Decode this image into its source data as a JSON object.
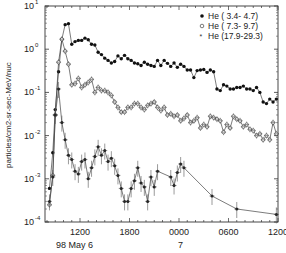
{
  "chart_data": {
    "type": "line",
    "title": "",
    "xlabel": "",
    "ylabel": "particles/cm2-sr-sec-MeV/nuc",
    "yscale": "log",
    "ylim": [
      0.0001,
      10
    ],
    "y_ticks": [
      {
        "base": "10",
        "exp": "1",
        "value": 10
      },
      {
        "base": "10",
        "exp": "0",
        "value": 1
      },
      {
        "base": "10",
        "exp": "-1",
        "value": 0.1
      },
      {
        "base": "10",
        "exp": "-2",
        "value": 0.01
      },
      {
        "base": "10",
        "exp": "-3",
        "value": 0.001
      },
      {
        "base": "10",
        "exp": "-4",
        "value": 0.0001
      }
    ],
    "xlim_hours": [
      7.7,
      36
    ],
    "x_ticks": [
      {
        "label": "1200",
        "hour": 12,
        "sublabel": "98 May  6"
      },
      {
        "label": "1800",
        "hour": 18,
        "sublabel": ""
      },
      {
        "label": "0000",
        "hour": 24,
        "sublabel": "7"
      },
      {
        "label": "0600",
        "hour": 30,
        "sublabel": ""
      },
      {
        "label": "1200",
        "hour": 36,
        "sublabel": ""
      }
    ],
    "x_units": "hours since 98 May 6 0000 UT",
    "legend_position": "upper right",
    "series": [
      {
        "name": "He ( 3.4- 4.7)",
        "marker": "filled-circle",
        "x": [
          8.3,
          8.7,
          9.0,
          9.4,
          9.8,
          10.2,
          10.6,
          11.0,
          11.4,
          11.8,
          12.2,
          12.6,
          13.0,
          13.4,
          13.8,
          14.2,
          14.6,
          15.0,
          15.4,
          15.8,
          16.2,
          16.6,
          17.0,
          17.4,
          17.8,
          18.2,
          18.6,
          19.0,
          19.4,
          19.8,
          20.2,
          20.6,
          21.0,
          21.4,
          21.8,
          22.2,
          22.6,
          23.0,
          23.4,
          23.8,
          24.2,
          24.6,
          25.0,
          25.4,
          25.8,
          26.2,
          26.6,
          27.0,
          27.4,
          27.8,
          28.2,
          28.6,
          29.0,
          29.4,
          29.8,
          30.2,
          30.6,
          31.0,
          31.4,
          31.8,
          32.2,
          32.6,
          33.0,
          33.4,
          33.8,
          34.2,
          34.6,
          35.0,
          35.4,
          35.8
        ],
        "values": [
          0.0006,
          0.004,
          0.04,
          0.3,
          1.7,
          3.7,
          3.9,
          1.3,
          1.5,
          1.6,
          1.6,
          1.8,
          1.65,
          1.3,
          1.25,
          0.85,
          0.75,
          0.62,
          0.55,
          0.48,
          0.52,
          0.7,
          0.6,
          0.72,
          0.6,
          0.55,
          0.48,
          0.46,
          0.42,
          0.5,
          0.45,
          0.42,
          0.4,
          0.55,
          0.42,
          0.55,
          0.47,
          0.4,
          0.48,
          0.38,
          0.45,
          0.4,
          0.33,
          0.33,
          0.22,
          0.32,
          0.33,
          0.34,
          0.29,
          0.33,
          0.3,
          0.12,
          0.11,
          0.15,
          0.14,
          0.12,
          0.12,
          0.13,
          0.13,
          0.14,
          0.12,
          0.12,
          0.11,
          0.13,
          0.1,
          0.06,
          0.055,
          0.07,
          0.06,
          0.07
        ],
        "color": "#111111"
      },
      {
        "name": "He ( 7.3- 9.7)",
        "marker": "open-circle",
        "x": [
          8.3,
          8.7,
          9.0,
          9.4,
          9.8,
          10.2,
          10.6,
          11.0,
          11.4,
          11.8,
          12.2,
          12.6,
          13.0,
          13.4,
          13.8,
          14.2,
          14.6,
          15.0,
          15.4,
          15.8,
          16.2,
          16.6,
          17.0,
          17.4,
          17.8,
          18.2,
          18.6,
          19.0,
          19.4,
          19.8,
          20.2,
          20.6,
          21.0,
          21.4,
          21.8,
          22.2,
          22.6,
          23.0,
          23.4,
          23.8,
          24.2,
          24.6,
          25.0,
          25.4,
          25.8,
          26.2,
          26.6,
          27.0,
          27.4,
          27.8,
          28.2,
          28.6,
          29.0,
          29.4,
          29.8,
          30.2,
          30.6,
          31.0,
          31.4,
          31.8,
          32.2,
          32.6,
          33.0,
          33.4,
          33.8,
          34.2,
          34.6,
          35.0,
          35.4,
          35.8
        ],
        "values": [
          0.00025,
          0.0012,
          0.03,
          0.5,
          1.7,
          0.9,
          0.45,
          0.15,
          0.16,
          0.21,
          0.13,
          0.15,
          0.17,
          0.2,
          0.1,
          0.13,
          0.11,
          0.11,
          0.1,
          0.085,
          0.06,
          0.045,
          0.035,
          0.035,
          0.045,
          0.045,
          0.055,
          0.055,
          0.045,
          0.04,
          0.05,
          0.055,
          0.06,
          0.045,
          0.038,
          0.045,
          0.03,
          0.032,
          0.028,
          0.03,
          0.022,
          0.025,
          0.03,
          0.02,
          0.022,
          0.026,
          0.015,
          0.018,
          0.016,
          0.028,
          0.026,
          0.024,
          0.022,
          0.012,
          0.018,
          0.015,
          0.028,
          0.024,
          0.022,
          0.016,
          0.018,
          0.014,
          0.013,
          0.01,
          0.011,
          0.008,
          0.01,
          0.008,
          0.02,
          0.011
        ],
        "color": "#444444"
      },
      {
        "name": "He (17.9-29.3)",
        "marker": "star",
        "x": [
          8.3,
          8.7,
          9.0,
          9.4,
          9.8,
          10.2,
          10.6,
          11.0,
          11.4,
          11.8,
          12.2,
          12.6,
          13.0,
          13.4,
          13.8,
          14.2,
          14.6,
          15.0,
          15.4,
          15.8,
          16.2,
          16.6,
          17.0,
          17.4,
          17.8,
          18.2,
          18.6,
          19.0,
          19.4,
          19.8,
          20.2,
          20.6,
          21.0,
          21.4,
          23.0,
          23.4,
          23.8,
          24.2,
          24.6,
          28.0,
          31.0,
          35.8
        ],
        "values": [
          0.0003,
          0.0011,
          0.03,
          0.12,
          0.02,
          0.008,
          0.0035,
          0.0028,
          0.0015,
          0.0013,
          0.0025,
          0.0028,
          0.001,
          0.0018,
          0.0033,
          0.0055,
          0.0035,
          0.0045,
          0.0025,
          0.003,
          0.002,
          0.0012,
          0.0006,
          0.0003,
          0.0003,
          0.0006,
          0.0009,
          0.0018,
          0.0008,
          0.00065,
          0.0003,
          0.0011,
          0.00065,
          0.0015,
          0.0011,
          0.0007,
          0.0014,
          0.0022,
          0.0018,
          0.0004,
          0.0002,
          0.00015
        ],
        "color": "#333333"
      }
    ]
  },
  "legend": {
    "items": [
      {
        "label": "He ( 3.4- 4.7)",
        "marker": "filled-circle"
      },
      {
        "label": "He ( 7.3- 9.7)",
        "marker": "open-circle"
      },
      {
        "label": "He (17.9-29.3)",
        "marker": "star"
      }
    ]
  },
  "axes": {
    "ylabel": "particles/cm2-sr-sec-MeV/nuc",
    "x_sub_day1": "98 May  6",
    "x_sub_day2": "7"
  }
}
